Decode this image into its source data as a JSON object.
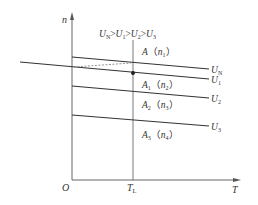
{
  "title_parts": {
    "un": "U",
    "un_sub": "N",
    "u1": "U",
    "u1_sub": "1",
    "u2": "U",
    "u2_sub": "2",
    "u3": "U",
    "u3_sub": "3",
    "gt": ">"
  },
  "axes": {
    "y_label": "n",
    "x_label": "T",
    "origin_label": "O",
    "tl_label": "T",
    "tl_sub": "L"
  },
  "curves": [
    {
      "name": "U_N",
      "label": "U",
      "sub": "N",
      "x1": 72,
      "y1": 57,
      "x2": 209,
      "y2": 69
    },
    {
      "name": "U_1",
      "label": "U",
      "sub": "1",
      "x1": 20,
      "y1": 62,
      "x2": 209,
      "y2": 79
    },
    {
      "name": "U_2",
      "label": "U",
      "sub": "2",
      "x1": 72,
      "y1": 86,
      "x2": 209,
      "y2": 98
    },
    {
      "name": "U_3",
      "label": "U",
      "sub": "3",
      "x1": 72,
      "y1": 115,
      "x2": 209,
      "y2": 126
    }
  ],
  "points": [
    {
      "name": "A",
      "label": "A",
      "n": "n",
      "n_sub": "1"
    },
    {
      "name": "A1",
      "label": "A",
      "label_sub": "1",
      "n": "n",
      "n_sub": "2"
    },
    {
      "name": "A2",
      "label": "A",
      "label_sub": "2",
      "n": "n",
      "n_sub": "3"
    },
    {
      "name": "A3",
      "label": "A",
      "label_sub": "3",
      "n": "n",
      "n_sub": "4"
    }
  ],
  "colors": {
    "line": "#333333",
    "axis": "#555555",
    "dashed": "#777777"
  }
}
